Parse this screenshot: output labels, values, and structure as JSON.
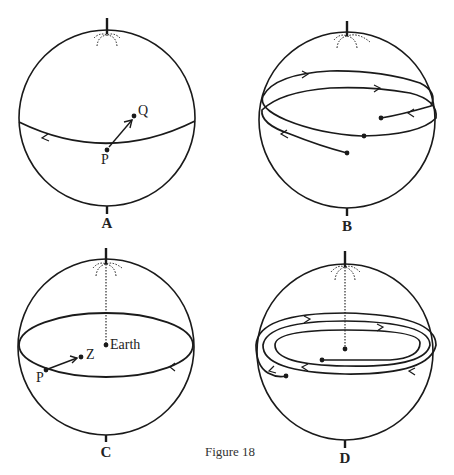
{
  "figure": {
    "caption": "Figure 18",
    "panels": [
      {
        "id": "A",
        "label": "A",
        "points": [
          "P",
          "Q"
        ]
      },
      {
        "id": "B",
        "label": "B",
        "points": []
      },
      {
        "id": "C",
        "label": "C",
        "points": [
          "P",
          "Z",
          "Earth"
        ]
      },
      {
        "id": "D",
        "label": "D",
        "points": []
      }
    ]
  },
  "labels": {
    "a_p": "P",
    "a_q": "Q",
    "c_p": "P",
    "c_z": "Z",
    "c_earth": "Earth"
  },
  "colors": {
    "ink": "#1a1a1a",
    "background": "#ffffff"
  }
}
